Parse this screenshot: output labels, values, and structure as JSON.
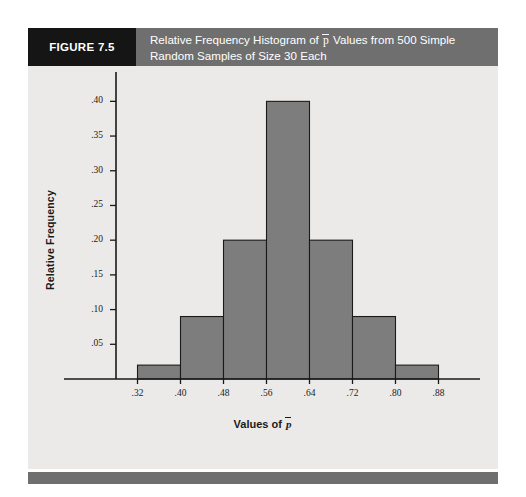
{
  "figure": {
    "badge": "FIGURE 7.5",
    "title_line1_pre": "Relative Frequency Histogram of ",
    "title_pbar": "p",
    "title_line1_post": " Values from 500 Simple",
    "title_line2": "Random Samples of Size 30 Each"
  },
  "colors": {
    "header_bar": "#6f6f6f",
    "badge_bg": "#151515",
    "card_bg": "#eceae8",
    "bar_fill": "#7d7d7d",
    "bar_stroke": "#1a1a1a",
    "axis": "#1a1a1a",
    "footer_bar": "#6f6f6f"
  },
  "axis_labels": {
    "x": "Values of",
    "x_symbol": "p",
    "y": "Relative Frequency"
  },
  "chart_data": {
    "type": "bar",
    "xlabel": "Values of p̄",
    "ylabel": "Relative Frequency",
    "grid": false,
    "legend": "none",
    "bin_edges": [
      0.32,
      0.4,
      0.48,
      0.56,
      0.64,
      0.72,
      0.8,
      0.88
    ],
    "bin_width": 0.08,
    "categories": [
      "0.32-0.40",
      "0.40-0.48",
      "0.48-0.56",
      "0.56-0.64",
      "0.64-0.72",
      "0.72-0.80",
      "0.80-0.88"
    ],
    "values": [
      0.02,
      0.09,
      0.2,
      0.4,
      0.2,
      0.09,
      0.02
    ],
    "xlim": [
      0.28,
      0.92
    ],
    "ylim": [
      0,
      0.425
    ],
    "xticks": [
      ".32",
      ".40",
      ".48",
      ".56",
      ".64",
      ".72",
      ".80",
      ".88"
    ],
    "xtick_values": [
      0.32,
      0.4,
      0.48,
      0.56,
      0.64,
      0.72,
      0.8,
      0.88
    ],
    "yticks": [
      ".05",
      ".10",
      ".15",
      ".20",
      ".25",
      ".30",
      ".35",
      ".40"
    ],
    "ytick_values": [
      0.05,
      0.1,
      0.15,
      0.2,
      0.25,
      0.3,
      0.35,
      0.4
    ]
  }
}
